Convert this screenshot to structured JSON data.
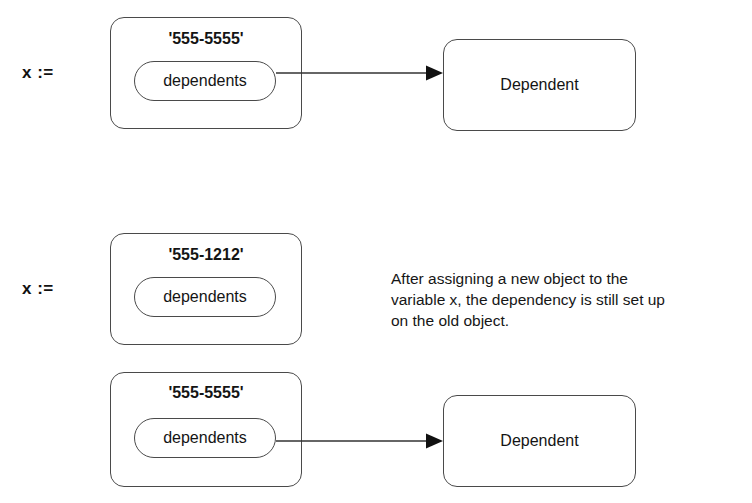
{
  "figure": {
    "background_color": "#ffffff",
    "line_color": "#4a4a4a",
    "text_color": "#141414"
  },
  "panels": [
    {
      "assignment_label": "x :=",
      "object": {
        "identifier": "'555-5555'",
        "instance_variable": "dependents",
        "has_dependency_arrow": true
      },
      "target": {
        "label": "Dependent"
      }
    },
    {
      "assignment_label": "x :=",
      "object": {
        "identifier": "'555-1212'",
        "instance_variable": "dependents",
        "has_dependency_arrow": false
      },
      "target": null
    },
    {
      "assignment_label": "",
      "object": {
        "identifier": "'555-5555'",
        "instance_variable": "dependents",
        "has_dependency_arrow": true
      },
      "target": {
        "label": "Dependent"
      }
    }
  ],
  "annotation": {
    "text": "After assigning a new object to the\nvariable x, the dependency is still set up\non the old object."
  },
  "icons": {
    "arrowhead": "solid-triangle-right"
  }
}
